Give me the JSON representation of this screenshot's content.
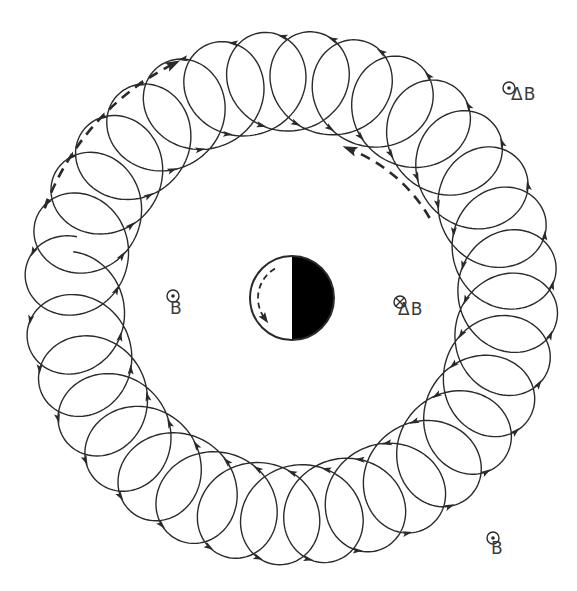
{
  "figure": {
    "colors": {
      "ink": "#2a2a2a",
      "background": "#ffffff",
      "fill": "#000000"
    }
  },
  "orbit": {
    "center": [
      291,
      298
    ],
    "guiding_radius": 217,
    "loop_radius": 50,
    "loops": 32,
    "direction": "clockwise",
    "start_angle_deg": 183,
    "gap_deg": 4,
    "arrow_count": 64
  },
  "central_sphere": {
    "center": [
      292,
      298
    ],
    "radius": 42,
    "dark_half": "right",
    "inner_arrow": "counterclockwise-dashed"
  },
  "drift_arrows": [
    {
      "name": "outer-drift-arrow",
      "radius": 262,
      "from_deg": 200,
      "to_deg": 243,
      "direction": "clockwise"
    },
    {
      "name": "inner-drift-arrow",
      "radius": 160,
      "from_deg": 330,
      "to_deg": 292,
      "direction": "counterclockwise"
    }
  ],
  "labels": {
    "b_center": {
      "text": "B",
      "symbol": "out-of-page",
      "x": 173,
      "y": 296
    },
    "delta_b_inner": {
      "text": "ΔB",
      "symbol": "into-page",
      "x": 400,
      "y": 302
    },
    "delta_b_top": {
      "text": "ΔB",
      "symbol": "out-of-page",
      "x": 509,
      "y": 88
    },
    "b_bottom": {
      "text": "B",
      "symbol": "out-of-page",
      "x": 493,
      "y": 538
    }
  }
}
